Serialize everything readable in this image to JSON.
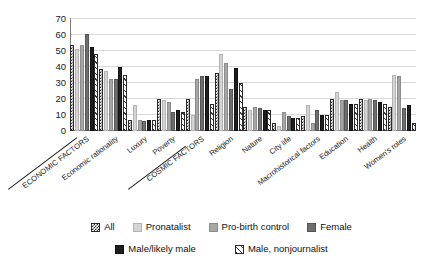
{
  "chart_data": {
    "type": "bar",
    "title": "",
    "subtitle": "",
    "xlabel": "",
    "ylabel": "",
    "ylim": [
      0,
      70
    ],
    "yticks": [
      0,
      10,
      20,
      30,
      40,
      50,
      60,
      70
    ],
    "grid": true,
    "legend_position": "bottom",
    "categories": [
      "ECONOMIC FACTORS",
      "Economic rationality",
      "Luxury",
      "Poverty",
      "COSMIC FACTORS",
      "Religion",
      "Nature",
      "City life",
      "Macrohistorical factors",
      "Education",
      "Health",
      "Women's roles"
    ],
    "series": [
      {
        "name": "All",
        "style": "checkered",
        "color": "#2b2b2b",
        "values": [
          53,
          38.5,
          7,
          20,
          20,
          36,
          15,
          5,
          9,
          20,
          20,
          15
        ]
      },
      {
        "name": "Pronatalist",
        "style": "light-gray",
        "color": "#d4d4d4",
        "values": [
          51,
          37,
          16,
          19,
          10,
          48,
          13,
          3,
          16,
          24,
          19,
          35
        ]
      },
      {
        "name": "Pro-birth control",
        "style": "medium-gray",
        "color": "#a6a6a6",
        "values": [
          53,
          32.5,
          7,
          18,
          32,
          42,
          15,
          12,
          5,
          19,
          20,
          34
        ]
      },
      {
        "name": "Female",
        "style": "dark-gray",
        "color": "#6e6e6e",
        "values": [
          60,
          32.5,
          6,
          12,
          34,
          26,
          14,
          9,
          13,
          19,
          19,
          14
        ]
      },
      {
        "name": "Male/likely male",
        "style": "black",
        "color": "#1e1e1e",
        "values": [
          52,
          39.5,
          7,
          13,
          34,
          39,
          13,
          8,
          10,
          17,
          18,
          16
        ]
      },
      {
        "name": "Male, nonjournalist",
        "style": "diagonal-hatch",
        "color": "#ffffff",
        "values": [
          47.5,
          34.5,
          7,
          12,
          17,
          30,
          13,
          8,
          10,
          17,
          17,
          5
        ]
      }
    ]
  },
  "legend": {
    "items": [
      {
        "label": "All",
        "swatch": "checkered-swatch"
      },
      {
        "label": "Pronatalist",
        "swatch": "light-gray-swatch"
      },
      {
        "label": "Pro-birth control",
        "swatch": "medium-gray-swatch"
      },
      {
        "label": "Female",
        "swatch": "dark-gray-swatch"
      },
      {
        "label": "Male/likely male",
        "swatch": "black-swatch"
      },
      {
        "label": "Male, nonjournalist",
        "swatch": "hatched-swatch"
      }
    ]
  },
  "axis": {
    "y_tick_labels": [
      "70",
      "60",
      "50",
      "40",
      "30",
      "20",
      "10",
      "0"
    ]
  }
}
